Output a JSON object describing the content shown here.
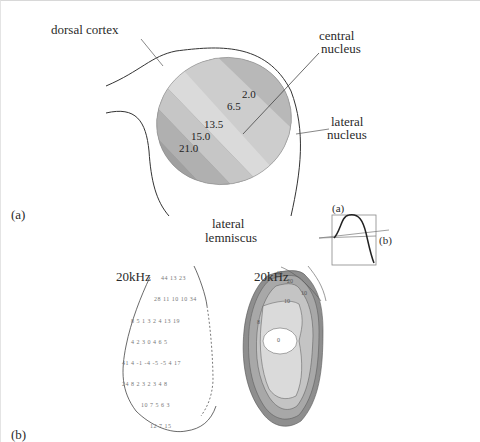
{
  "panel_a": {
    "label": "(a)",
    "labels": {
      "dorsal_cortex": "dorsal cortex",
      "central_nucleus_1": "central",
      "central_nucleus_2": "nucleus",
      "lateral_nucleus_1": "lateral",
      "lateral_nucleus_2": "nucleus",
      "lateral_lemniscus_1": "lateral",
      "lateral_lemniscus_2": "lemniscus"
    },
    "frequency_bands_khz": [
      "2.0",
      "6.5",
      "13.5",
      "15.0",
      "21.0"
    ],
    "inset": {
      "label_a": "(a)",
      "label_b": "(b)"
    },
    "band_colors": [
      "#9a9a9a",
      "#b4b4b4",
      "#c8c8c8",
      "#d8d8d8",
      "#c2c2c2",
      "#a8a8a8",
      "#969696"
    ]
  },
  "panel_b": {
    "label": "(b)",
    "left_map": {
      "title": "20kHz",
      "rows": [
        "44  13  23",
        "28  11  10  10  34",
        "8   5   1   3   2   4   13 19",
        "4   2   3   0   4   6   5",
        "41  4  -1  -4  -5  -5   4  17",
        "24  8   2   3   2   3   4   8",
        "10  7   5   6   3",
        "12  7   15"
      ]
    },
    "right_map": {
      "title": "20kHz",
      "contour_labels": [
        "40",
        "20",
        "10",
        "10",
        "8",
        "0"
      ],
      "fill_colors": [
        "#8e8e8e",
        "#a8a8a8",
        "#c4c4c4",
        "#dadada",
        "#ffffff"
      ]
    }
  }
}
